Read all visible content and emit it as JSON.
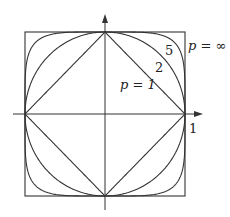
{
  "axes": {
    "x_tick_label": "1",
    "arrows": true
  },
  "curves": [
    {
      "p": 1,
      "label": "p = 1"
    },
    {
      "p": 2,
      "label": "2"
    },
    {
      "p": 5,
      "label": "5"
    },
    {
      "p": "inf",
      "label": "p = ∞"
    }
  ],
  "labels": {
    "p1": "p = 1",
    "p2": "2",
    "p5": "5",
    "pinf": "p = ∞",
    "tick": "1"
  },
  "colors": {
    "stroke": "#333333",
    "background": "#ffffff"
  }
}
